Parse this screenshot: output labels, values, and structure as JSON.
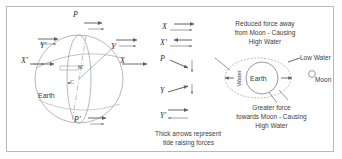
{
  "figure": {
    "background": "#ffffff",
    "frame_color": "#b9b9b9",
    "line_color": "#777777",
    "text_color": "#3d3d3d"
  },
  "earth_diagram": {
    "body_label": "Earth",
    "center_label": "C",
    "angle_label": "θΓ",
    "points": {
      "pole_north": "P",
      "pole_south": "P'",
      "equator_right": "X",
      "equator_left": "X'",
      "mid_right": "Y",
      "mid_left": "Y'"
    }
  },
  "vector_legend": {
    "rows": [
      {
        "label": "X",
        "desc": "two right arrows, equal"
      },
      {
        "label": "X'",
        "desc": "left arrow over right arrow"
      },
      {
        "label": "P",
        "desc": "right-down arrow and down arrow"
      },
      {
        "label": "Y",
        "desc": "right-up arrow and down arrow"
      },
      {
        "label": "Y'",
        "desc": "right arrow and left arrow"
      }
    ],
    "caption_line1": "Thick arrows represent",
    "caption_line2": "tide raising forces"
  },
  "moon_diagram": {
    "earth_label": "Earth",
    "water_label": "Water",
    "moon_label": "Moon",
    "low_water_label": "Low Water",
    "note_far": {
      "line1": "Reduced force away",
      "line2": "from Moon - Causing",
      "line3": "High Water"
    },
    "note_near": {
      "line1": "Greater force",
      "line2": "towards Moon - Causing",
      "line3": "High Water"
    }
  }
}
